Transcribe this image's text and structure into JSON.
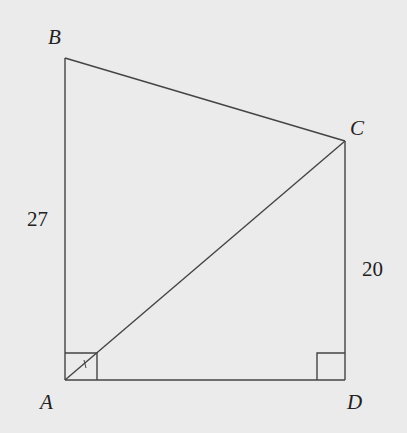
{
  "diagram": {
    "type": "quadrilateral",
    "vertices": {
      "A": {
        "label": "A",
        "x": 65,
        "y": 380
      },
      "B": {
        "label": "B",
        "x": 65,
        "y": 58
      },
      "C": {
        "label": "C",
        "x": 345,
        "y": 141
      },
      "D": {
        "label": "D",
        "x": 345,
        "y": 380
      }
    },
    "segments": [
      "AB",
      "BC",
      "CD",
      "DA",
      "AC"
    ],
    "side_labels": {
      "AB": "27",
      "CD": "20"
    },
    "right_angles": [
      "A",
      "D"
    ],
    "colors": {
      "background": "#ebebeb",
      "stroke": "#444444",
      "text": "#222222"
    }
  }
}
